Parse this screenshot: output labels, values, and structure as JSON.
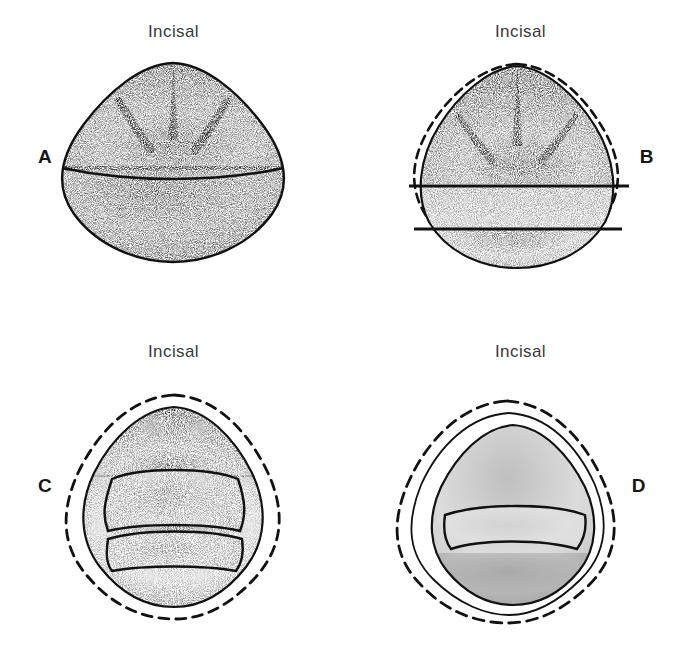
{
  "figure": {
    "background_color": "#ffffff",
    "ink_color": "#1a1a1a",
    "label_color": "#3a3a3c"
  },
  "panels": [
    {
      "letter": "A",
      "letter_side": "left",
      "caption": "Incisal",
      "description": "unprepared tooth, incisal view, fully stippled rounded-triangular outline",
      "has_dashed_original_outline": false,
      "inner_bands": 0
    },
    {
      "letter": "B",
      "letter_side": "right",
      "caption": "Incisal",
      "description": "tooth with single flat facial reduction plane, dashed original contour",
      "has_dashed_original_outline": true,
      "inner_bands": 1
    },
    {
      "letter": "C",
      "letter_side": "left",
      "caption": "Incisal",
      "description": "tooth with two-plane facial reduction, dashed original contour",
      "has_dashed_original_outline": true,
      "inner_bands": 2
    },
    {
      "letter": "D",
      "letter_side": "right",
      "caption": "Incisal",
      "description": "completed preparation with concentric reduction contours and dashed original outline",
      "has_dashed_original_outline": true,
      "inner_bands": 2
    }
  ]
}
